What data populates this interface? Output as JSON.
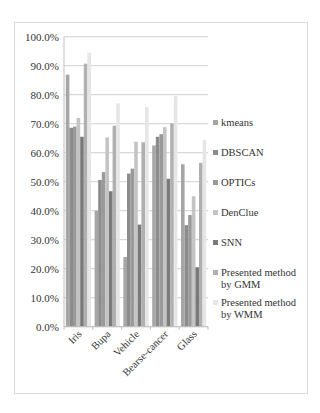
{
  "chart_data": {
    "type": "bar",
    "title": "",
    "xlabel": "",
    "ylabel": "",
    "ylim": [
      0,
      100
    ],
    "yticks": [
      "0.0%",
      "10.0%",
      "20.0%",
      "30.0%",
      "40.0%",
      "50.0%",
      "60.0%",
      "70.0%",
      "80.0%",
      "90.0%",
      "100.0%"
    ],
    "grid": true,
    "legend_position": "right",
    "categories": [
      "Iris",
      "Bupa",
      "Vehicle",
      "Bearse-cancer",
      "Glass"
    ],
    "series": [
      {
        "name": "kmeans",
        "color": "#a6a6a6",
        "values": [
          86.9,
          40.0,
          24.0,
          62.5,
          56.0
        ]
      },
      {
        "name": "DBSCAN",
        "color": "#8c8c8c",
        "values": [
          68.6,
          50.6,
          52.8,
          65.5,
          35.0
        ]
      },
      {
        "name": "OPTICs",
        "color": "#9a9a9a",
        "values": [
          69.0,
          53.3,
          54.5,
          66.4,
          38.5
        ]
      },
      {
        "name": "DenClue",
        "color": "#c4c4c4",
        "values": [
          72.0,
          65.3,
          63.8,
          68.8,
          45.0
        ]
      },
      {
        "name": "SNN",
        "color": "#7a7a7a",
        "values": [
          65.5,
          46.7,
          35.2,
          51.0,
          20.5
        ]
      },
      {
        "name": "Presented method by GMM",
        "color": "#b0b0b0",
        "values": [
          90.7,
          69.3,
          63.6,
          70.1,
          56.5
        ]
      },
      {
        "name": "Presented method by WMM",
        "color": "#e6e6e6",
        "values": [
          94.5,
          77.0,
          75.7,
          79.5,
          64.4
        ]
      }
    ]
  },
  "legend": [
    {
      "line1": "kmeans",
      "line2": ""
    },
    {
      "line1": "DBSCAN",
      "line2": ""
    },
    {
      "line1": "OPTICs",
      "line2": ""
    },
    {
      "line1": "DenClue",
      "line2": ""
    },
    {
      "line1": "SNN",
      "line2": ""
    },
    {
      "line1": "Presented method",
      "line2": "by GMM"
    },
    {
      "line1": "Presented method",
      "line2": "by WMM"
    }
  ]
}
